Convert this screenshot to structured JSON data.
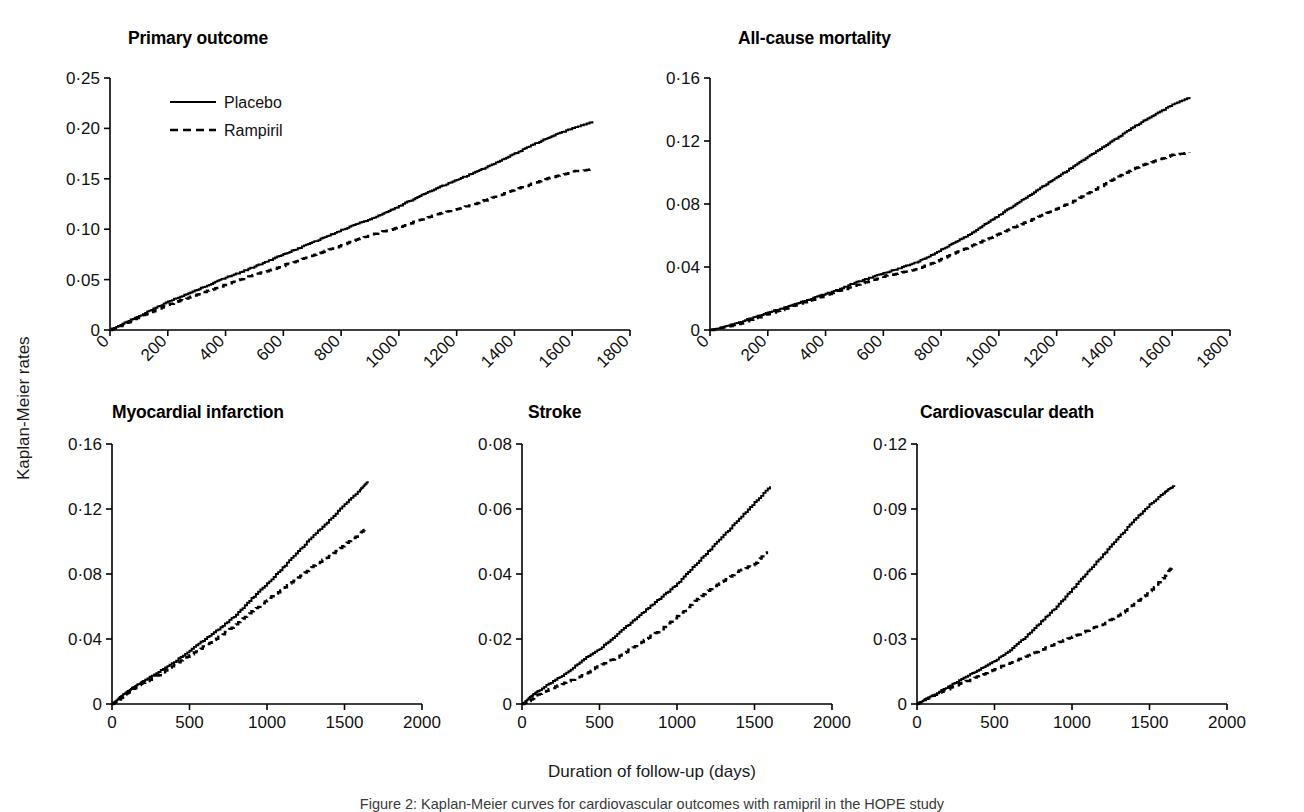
{
  "figure": {
    "ylabel": "Kaplan-Meier rates",
    "xlabel": "Duration of follow-up (days)",
    "caption": "Figure 2: Kaplan-Meier curves for cardiovascular outcomes with ramipril in the HOPE study",
    "legend": {
      "placebo": "Placebo",
      "ramipril": "Rampiril"
    }
  },
  "chart_data": [
    {
      "type": "line",
      "title": "Primary outcome",
      "xlabel": "",
      "ylabel": "Kaplan-Meier rates",
      "xlim": [
        0,
        1800
      ],
      "ylim": [
        0,
        0.25
      ],
      "xticks": [
        0,
        200,
        400,
        600,
        800,
        1000,
        1200,
        1400,
        1600,
        1800
      ],
      "xticklabels": [
        "0",
        "200",
        "400",
        "600",
        "800",
        "1000",
        "1200",
        "1400",
        "1600",
        "1800"
      ],
      "yticks": [
        0,
        0.05,
        0.1,
        0.15,
        0.2,
        0.25
      ],
      "yticklabels": [
        "0",
        "0·05",
        "0·10",
        "0·15",
        "0·20",
        "0·25"
      ],
      "xtick_rotation": 45,
      "grid": false,
      "legend_position": "upper-left",
      "series": [
        {
          "name": "Placebo",
          "style": "solid",
          "x": [
            0,
            50,
            100,
            150,
            200,
            250,
            300,
            350,
            400,
            450,
            500,
            550,
            600,
            650,
            700,
            750,
            800,
            850,
            900,
            950,
            1000,
            1050,
            1100,
            1150,
            1200,
            1250,
            1300,
            1350,
            1400,
            1450,
            1500,
            1550,
            1600,
            1670
          ],
          "values": [
            0,
            0.007,
            0.014,
            0.021,
            0.028,
            0.034,
            0.04,
            0.046,
            0.052,
            0.057,
            0.063,
            0.069,
            0.075,
            0.081,
            0.087,
            0.093,
            0.099,
            0.105,
            0.11,
            0.116,
            0.123,
            0.13,
            0.137,
            0.143,
            0.149,
            0.155,
            0.161,
            0.168,
            0.175,
            0.182,
            0.189,
            0.195,
            0.2,
            0.207
          ]
        },
        {
          "name": "Rampiril",
          "style": "dashed",
          "x": [
            0,
            50,
            100,
            150,
            200,
            250,
            300,
            350,
            400,
            450,
            500,
            550,
            600,
            650,
            700,
            750,
            800,
            850,
            900,
            950,
            1000,
            1050,
            1100,
            1150,
            1200,
            1250,
            1300,
            1350,
            1400,
            1450,
            1500,
            1550,
            1600,
            1670
          ],
          "values": [
            0,
            0.006,
            0.013,
            0.019,
            0.025,
            0.03,
            0.035,
            0.04,
            0.045,
            0.05,
            0.055,
            0.059,
            0.064,
            0.069,
            0.074,
            0.079,
            0.084,
            0.089,
            0.094,
            0.098,
            0.102,
            0.107,
            0.112,
            0.116,
            0.12,
            0.124,
            0.129,
            0.134,
            0.139,
            0.144,
            0.149,
            0.153,
            0.157,
            0.16
          ]
        }
      ]
    },
    {
      "type": "line",
      "title": "All-cause mortality",
      "xlabel": "",
      "ylabel": "Kaplan-Meier rates",
      "xlim": [
        0,
        1800
      ],
      "ylim": [
        0,
        0.16
      ],
      "xticks": [
        0,
        200,
        400,
        600,
        800,
        1000,
        1200,
        1400,
        1600,
        1800
      ],
      "xticklabels": [
        "0",
        "200",
        "400",
        "600",
        "800",
        "1000",
        "1200",
        "1400",
        "1600",
        "1800"
      ],
      "yticks": [
        0,
        0.04,
        0.08,
        0.12,
        0.16
      ],
      "yticklabels": [
        "0",
        "0·04",
        "0·08",
        "0·12",
        "0·16"
      ],
      "xtick_rotation": 45,
      "grid": false,
      "legend_position": "none",
      "series": [
        {
          "name": "Placebo",
          "style": "solid",
          "x": [
            0,
            50,
            100,
            150,
            200,
            250,
            300,
            350,
            400,
            450,
            500,
            550,
            600,
            650,
            700,
            750,
            800,
            850,
            900,
            950,
            1000,
            1050,
            1100,
            1150,
            1200,
            1250,
            1300,
            1350,
            1400,
            1450,
            1500,
            1550,
            1600,
            1660
          ],
          "values": [
            0,
            0.002,
            0.005,
            0.008,
            0.011,
            0.014,
            0.017,
            0.02,
            0.023,
            0.026,
            0.03,
            0.033,
            0.036,
            0.039,
            0.042,
            0.046,
            0.051,
            0.056,
            0.061,
            0.067,
            0.073,
            0.079,
            0.085,
            0.091,
            0.097,
            0.103,
            0.109,
            0.115,
            0.121,
            0.127,
            0.133,
            0.138,
            0.143,
            0.148
          ]
        },
        {
          "name": "Rampiril",
          "style": "dashed",
          "x": [
            0,
            50,
            100,
            150,
            200,
            250,
            300,
            350,
            400,
            450,
            500,
            550,
            600,
            650,
            700,
            750,
            800,
            850,
            900,
            950,
            1000,
            1050,
            1100,
            1150,
            1200,
            1250,
            1300,
            1350,
            1400,
            1450,
            1500,
            1550,
            1600,
            1660
          ],
          "values": [
            0,
            0.002,
            0.004,
            0.007,
            0.01,
            0.013,
            0.016,
            0.019,
            0.022,
            0.025,
            0.028,
            0.031,
            0.034,
            0.036,
            0.038,
            0.041,
            0.045,
            0.049,
            0.053,
            0.057,
            0.061,
            0.065,
            0.069,
            0.073,
            0.077,
            0.081,
            0.086,
            0.091,
            0.096,
            0.101,
            0.105,
            0.108,
            0.111,
            0.113
          ]
        }
      ]
    },
    {
      "type": "line",
      "title": "Myocardial infarction",
      "xlabel": "",
      "ylabel": "Kaplan-Meier rates",
      "xlim": [
        0,
        2000
      ],
      "ylim": [
        0,
        0.16
      ],
      "xticks": [
        0,
        500,
        1000,
        1500,
        2000
      ],
      "xticklabels": [
        "0",
        "500",
        "1000",
        "1500",
        "2000"
      ],
      "yticks": [
        0,
        0.04,
        0.08,
        0.12,
        0.16
      ],
      "yticklabels": [
        "0",
        "0·04",
        "0·08",
        "0·12",
        "0·16"
      ],
      "xtick_rotation": 0,
      "grid": false,
      "legend_position": "none",
      "series": [
        {
          "name": "Placebo",
          "style": "solid",
          "x": [
            0,
            50,
            100,
            150,
            200,
            300,
            400,
            500,
            600,
            700,
            800,
            900,
            1000,
            1100,
            1200,
            1300,
            1400,
            1500,
            1600,
            1650
          ],
          "values": [
            0,
            0.004,
            0.008,
            0.011,
            0.014,
            0.02,
            0.026,
            0.033,
            0.04,
            0.047,
            0.055,
            0.065,
            0.074,
            0.084,
            0.094,
            0.104,
            0.113,
            0.123,
            0.132,
            0.137
          ]
        },
        {
          "name": "Rampiril",
          "style": "dashed",
          "x": [
            0,
            50,
            100,
            150,
            200,
            300,
            400,
            500,
            600,
            700,
            800,
            900,
            1000,
            1100,
            1200,
            1300,
            1400,
            1500,
            1600,
            1640
          ],
          "values": [
            0,
            0.003,
            0.007,
            0.01,
            0.013,
            0.018,
            0.024,
            0.03,
            0.036,
            0.042,
            0.049,
            0.057,
            0.064,
            0.071,
            0.078,
            0.085,
            0.091,
            0.098,
            0.105,
            0.108
          ]
        }
      ]
    },
    {
      "type": "line",
      "title": "Stroke",
      "xlabel": "",
      "ylabel": "Kaplan-Meier rates",
      "xlim": [
        0,
        2000
      ],
      "ylim": [
        0,
        0.08
      ],
      "xticks": [
        0,
        500,
        1000,
        1500,
        2000
      ],
      "xticklabels": [
        "0",
        "500",
        "1000",
        "1500",
        "2000"
      ],
      "yticks": [
        0,
        0.02,
        0.04,
        0.06,
        0.08
      ],
      "yticklabels": [
        "0",
        "0·02",
        "0·04",
        "0·06",
        "0·08"
      ],
      "xtick_rotation": 0,
      "grid": false,
      "legend_position": "none",
      "series": [
        {
          "name": "Placebo",
          "style": "solid",
          "x": [
            0,
            50,
            100,
            200,
            300,
            400,
            500,
            600,
            700,
            800,
            900,
            1000,
            1100,
            1200,
            1300,
            1400,
            1500,
            1600
          ],
          "values": [
            0,
            0.002,
            0.004,
            0.007,
            0.01,
            0.014,
            0.017,
            0.021,
            0.025,
            0.029,
            0.033,
            0.037,
            0.042,
            0.047,
            0.052,
            0.057,
            0.062,
            0.067
          ]
        },
        {
          "name": "Rampiril",
          "style": "dashed",
          "x": [
            0,
            50,
            100,
            200,
            300,
            400,
            500,
            600,
            700,
            800,
            900,
            1000,
            1100,
            1200,
            1300,
            1400,
            1500,
            1580
          ],
          "values": [
            0,
            0.001,
            0.003,
            0.005,
            0.007,
            0.009,
            0.012,
            0.014,
            0.017,
            0.02,
            0.023,
            0.027,
            0.031,
            0.035,
            0.038,
            0.041,
            0.043,
            0.047
          ]
        }
      ]
    },
    {
      "type": "line",
      "title": "Cardiovascular death",
      "xlabel": "",
      "ylabel": "Kaplan-Meier rates",
      "xlim": [
        0,
        2000
      ],
      "ylim": [
        0,
        0.12
      ],
      "xticks": [
        0,
        500,
        1000,
        1500,
        2000
      ],
      "xticklabels": [
        "0",
        "500",
        "1000",
        "1500",
        "2000"
      ],
      "yticks": [
        0,
        0.03,
        0.06,
        0.09,
        0.12
      ],
      "yticklabels": [
        "0",
        "0·03",
        "0·06",
        "0·09",
        "0·12"
      ],
      "xtick_rotation": 0,
      "grid": false,
      "legend_position": "none",
      "series": [
        {
          "name": "Placebo",
          "style": "solid",
          "x": [
            0,
            50,
            100,
            200,
            300,
            400,
            500,
            600,
            700,
            800,
            900,
            1000,
            1100,
            1200,
            1300,
            1400,
            1500,
            1600,
            1660
          ],
          "values": [
            0,
            0.002,
            0.004,
            0.008,
            0.012,
            0.016,
            0.02,
            0.025,
            0.031,
            0.038,
            0.045,
            0.053,
            0.061,
            0.069,
            0.077,
            0.085,
            0.092,
            0.098,
            0.101
          ]
        },
        {
          "name": "Rampiril",
          "style": "dashed",
          "x": [
            0,
            50,
            100,
            200,
            300,
            400,
            500,
            600,
            700,
            800,
            900,
            1000,
            1100,
            1200,
            1300,
            1400,
            1500,
            1600,
            1650
          ],
          "values": [
            0,
            0.002,
            0.004,
            0.007,
            0.01,
            0.013,
            0.016,
            0.019,
            0.022,
            0.025,
            0.028,
            0.031,
            0.034,
            0.037,
            0.041,
            0.046,
            0.052,
            0.059,
            0.064
          ]
        }
      ]
    }
  ]
}
